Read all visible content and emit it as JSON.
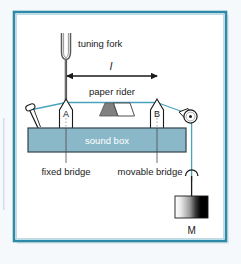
{
  "figure": {
    "frame_color": "#2e8aa8",
    "background": "#ffffff",
    "page_background": "#f4f8fa"
  },
  "labels": {
    "tuning_fork": "tuning fork",
    "length_symbol": "l",
    "paper_rider": "paper rider",
    "bridge_a": "A",
    "bridge_b": "B",
    "sound_box": "sound box",
    "fixed_bridge": "fixed bridge",
    "movable_bridge": "movable bridge",
    "mass": "M"
  },
  "colors": {
    "string": "#4aa3bd",
    "sound_box_fill": "#8bb8c9",
    "sound_box_stroke": "#33424a",
    "sound_box_text": "#ffffff",
    "text": "#1a1a1a",
    "outline": "#1a1a1a",
    "rider_gray": "#808080",
    "mass_light": "#ffffff",
    "mass_dark": "#000000"
  },
  "parts": [
    {
      "name": "tuning-fork",
      "label": "tuning fork"
    },
    {
      "name": "length-dimension-arrow",
      "label": "l"
    },
    {
      "name": "paper-rider",
      "label": "paper rider"
    },
    {
      "name": "bridge-a",
      "label": "A"
    },
    {
      "name": "bridge-b",
      "label": "B"
    },
    {
      "name": "sound-box",
      "label": "sound box"
    },
    {
      "name": "tuning-peg",
      "label": ""
    },
    {
      "name": "pulley",
      "label": ""
    },
    {
      "name": "hanging-mass",
      "label": "M"
    }
  ]
}
